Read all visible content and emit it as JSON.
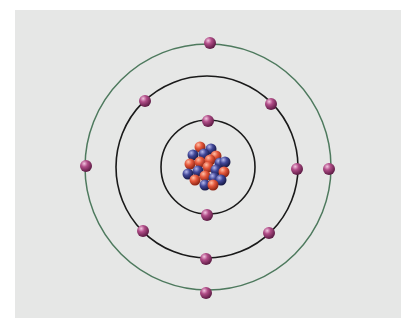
{
  "diagram": {
    "type": "bohr-atom-model",
    "background": "#e6e7e6",
    "nucleus": {
      "center": [
        207,
        166
      ],
      "proton_color": "#e0523a",
      "neutron_color": "#3a3f8f",
      "particle_count": 24
    },
    "shells": [
      {
        "name": "shell-1",
        "radius": 47,
        "color": "#1a1a1a",
        "electrons": 2
      },
      {
        "name": "shell-2",
        "radius": 91,
        "color": "#1a1a1a",
        "electrons": 8
      },
      {
        "name": "shell-3",
        "radius": 123,
        "color": "#4e7a5e",
        "electrons": 4
      }
    ],
    "electron_color": "#a2417a",
    "total_electrons": 14
  }
}
